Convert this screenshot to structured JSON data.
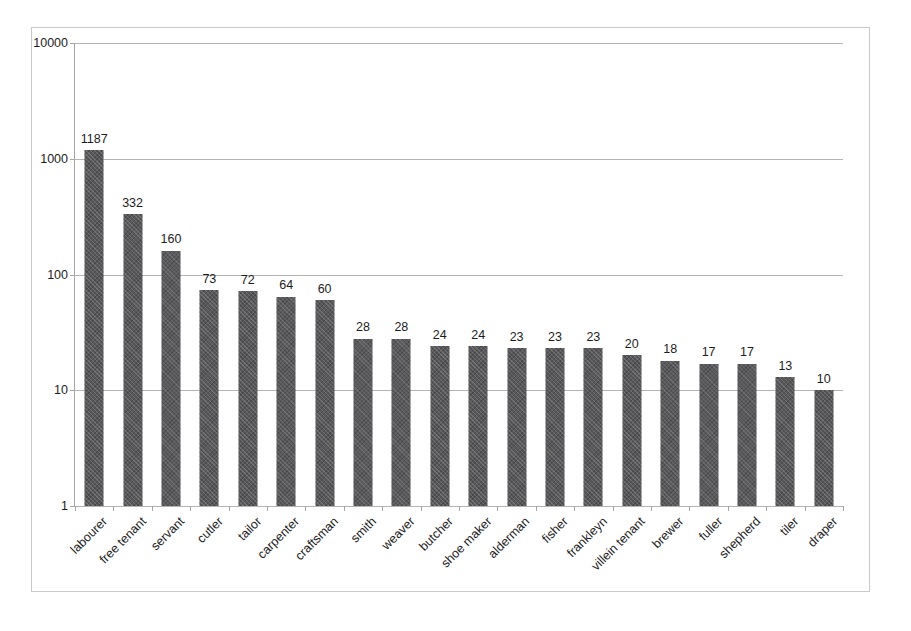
{
  "chart_data": {
    "type": "bar",
    "title": "",
    "subtitle": "",
    "xlabel": "",
    "ylabel": "",
    "yscale": "log",
    "ylim": [
      1,
      10000
    ],
    "ytick_labels": [
      "1",
      "10",
      "100",
      "1000",
      "10000"
    ],
    "ytick_values": [
      1,
      10,
      100,
      1000,
      10000
    ],
    "grid": true,
    "legend": false,
    "legend_position": "none",
    "bar_color": "#58585a",
    "categories": [
      "labourer",
      "free tenant",
      "servant",
      "cutler",
      "tailor",
      "carpenter",
      "craftsman",
      "smith",
      "weaver",
      "butcher",
      "shoe maker",
      "alderman",
      "fisher",
      "frankleyn",
      "villein tenant",
      "brewer",
      "fuller",
      "shepherd",
      "tiler",
      "draper"
    ],
    "values": [
      1187,
      332,
      160,
      73,
      72,
      64,
      60,
      28,
      28,
      24,
      24,
      23,
      23,
      23,
      20,
      18,
      17,
      17,
      13,
      10
    ],
    "data_labels": [
      "1187",
      "332",
      "160",
      "73",
      "72",
      "64",
      "60",
      "28",
      "28",
      "24",
      "24",
      "23",
      "23",
      "23",
      "20",
      "18",
      "17",
      "17",
      "13",
      "10"
    ]
  }
}
